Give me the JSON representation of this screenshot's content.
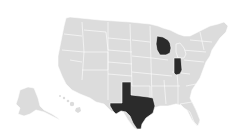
{
  "map": {
    "type": "choropleth",
    "region": "United States",
    "colors": {
      "background": "#ffffff",
      "default_fill": "#dcdcdc",
      "highlight_fill": "#2b2b2b",
      "border": "#ffffff"
    },
    "highlighted_states": [
      "Wisconsin",
      "Indiana",
      "Texas"
    ]
  }
}
